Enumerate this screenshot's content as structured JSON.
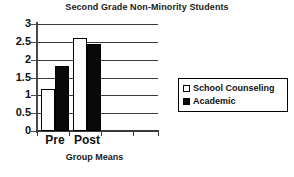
{
  "chart_data": {
    "type": "bar",
    "title": "Second Grade Non-Minority Students",
    "xlabel": "Group Means",
    "ylabel": "",
    "categories": [
      "Pre",
      "Post"
    ],
    "series": [
      {
        "name": "School Counseling",
        "values": [
          1.18,
          2.6
        ],
        "color": "#ffffff"
      },
      {
        "name": "Academic",
        "values": [
          1.82,
          2.44
        ],
        "color": "#000000"
      }
    ],
    "ylim": [
      0,
      3
    ],
    "ytick_labels": [
      "0",
      "0.5",
      "1",
      "1.5",
      "2",
      "2.5",
      "3"
    ],
    "ytick_values": [
      0,
      0.5,
      1,
      1.5,
      2,
      2.5,
      3
    ],
    "grid": true,
    "legend_position": "right",
    "legend_entries": [
      {
        "label": "School Counseling",
        "swatch": "hollow-square-icon"
      },
      {
        "label": "Academic",
        "swatch": "filled-square-icon"
      }
    ]
  }
}
